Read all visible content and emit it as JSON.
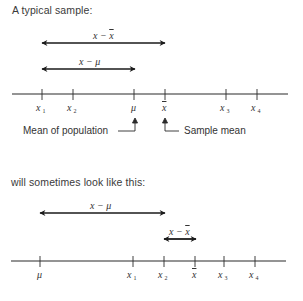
{
  "top": {
    "caption": "A typical sample:",
    "arrows": [
      {
        "label": "x − x̄",
        "label_main": "x − ",
        "label_bar": "x",
        "from": 42,
        "to": 165,
        "y": 43
      },
      {
        "label": "x − μ",
        "label_main": "x − μ",
        "from": 42,
        "to": 134,
        "y": 69
      }
    ],
    "axis": {
      "ticks": [
        {
          "name": "x1",
          "base": "x",
          "sub": "1",
          "x": 42
        },
        {
          "name": "x2",
          "base": "x",
          "sub": "2",
          "x": 73
        },
        {
          "name": "mu",
          "base": "μ",
          "x": 134
        },
        {
          "name": "xbar",
          "base": "x",
          "bar": true,
          "x": 165
        },
        {
          "name": "x3",
          "base": "x",
          "sub": "3",
          "x": 226
        },
        {
          "name": "x4",
          "base": "x",
          "sub": "4",
          "x": 257
        }
      ]
    },
    "notes": {
      "population": "Mean of population",
      "sample": "Sample mean"
    }
  },
  "bottom": {
    "caption": "will sometimes look like this:",
    "arrows": [
      {
        "label": "x − μ",
        "label_main": "x − μ",
        "from": 40,
        "to": 164,
        "y": 213
      },
      {
        "label": "x − x̄",
        "label_main": "x − ",
        "label_bar": "x",
        "from": 164,
        "to": 195,
        "y": 239
      }
    ],
    "axis": {
      "ticks": [
        {
          "name": "mu",
          "base": "μ",
          "x": 40
        },
        {
          "name": "x1",
          "base": "x",
          "sub": "1",
          "x": 133
        },
        {
          "name": "x2",
          "base": "x",
          "sub": "2",
          "x": 164
        },
        {
          "name": "xbar",
          "base": "x",
          "bar": true,
          "x": 195
        },
        {
          "name": "x3",
          "base": "x",
          "sub": "3",
          "x": 224
        },
        {
          "name": "x4",
          "base": "x",
          "sub": "4",
          "x": 255
        }
      ]
    }
  }
}
